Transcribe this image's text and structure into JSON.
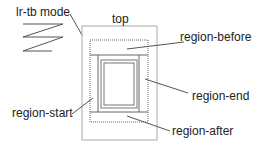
{
  "diagram": {
    "mode_label": "lr-tb mode",
    "top_label": "top",
    "regions": {
      "before": "region-before",
      "end": "region-end",
      "start": "region-start",
      "after": "region-after"
    },
    "colors": {
      "line": "#555555",
      "box": "#aaaaaa",
      "text": "#222222"
    }
  }
}
